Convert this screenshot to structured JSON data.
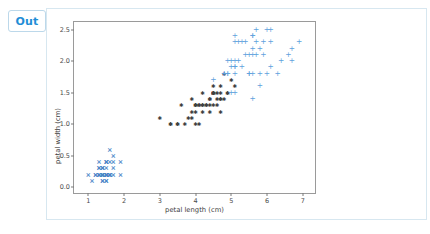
{
  "cell": {
    "out_label": "Out"
  },
  "chart_data": {
    "type": "scatter",
    "title": "",
    "xlabel": "petal length (cm)",
    "ylabel": "petal width (cm)",
    "xlim": [
      0.6,
      7.4
    ],
    "ylim": [
      -0.12,
      2.62
    ],
    "xticks": [
      "1",
      "2",
      "3",
      "4",
      "5",
      "6",
      "7"
    ],
    "xtick_values": [
      1,
      2,
      3,
      4,
      5,
      6,
      7
    ],
    "yticks": [
      "0.0",
      "0.5",
      "1.0",
      "1.5",
      "2.0",
      "2.5"
    ],
    "ytick_values": [
      0.0,
      0.5,
      1.0,
      1.5,
      2.0,
      2.5
    ],
    "grid": false,
    "legend": "none",
    "series": [
      {
        "name": "setosa",
        "marker": "x",
        "glyph": "×",
        "color": "#4a86c8",
        "points": [
          [
            1.4,
            0.2
          ],
          [
            1.4,
            0.2
          ],
          [
            1.3,
            0.2
          ],
          [
            1.5,
            0.2
          ],
          [
            1.4,
            0.2
          ],
          [
            1.7,
            0.4
          ],
          [
            1.4,
            0.3
          ],
          [
            1.5,
            0.2
          ],
          [
            1.4,
            0.2
          ],
          [
            1.5,
            0.1
          ],
          [
            1.5,
            0.2
          ],
          [
            1.6,
            0.2
          ],
          [
            1.4,
            0.1
          ],
          [
            1.1,
            0.1
          ],
          [
            1.2,
            0.2
          ],
          [
            1.5,
            0.4
          ],
          [
            1.3,
            0.4
          ],
          [
            1.4,
            0.3
          ],
          [
            1.7,
            0.3
          ],
          [
            1.5,
            0.3
          ],
          [
            1.7,
            0.2
          ],
          [
            1.5,
            0.4
          ],
          [
            1.0,
            0.2
          ],
          [
            1.7,
            0.5
          ],
          [
            1.9,
            0.2
          ],
          [
            1.6,
            0.2
          ],
          [
            1.6,
            0.4
          ],
          [
            1.5,
            0.2
          ],
          [
            1.4,
            0.2
          ],
          [
            1.6,
            0.2
          ],
          [
            1.6,
            0.2
          ],
          [
            1.5,
            0.4
          ],
          [
            1.5,
            0.1
          ],
          [
            1.4,
            0.2
          ],
          [
            1.5,
            0.2
          ],
          [
            1.2,
            0.2
          ],
          [
            1.3,
            0.2
          ],
          [
            1.4,
            0.1
          ],
          [
            1.3,
            0.2
          ],
          [
            1.5,
            0.2
          ],
          [
            1.3,
            0.3
          ],
          [
            1.3,
            0.3
          ],
          [
            1.3,
            0.2
          ],
          [
            1.6,
            0.6
          ],
          [
            1.9,
            0.4
          ],
          [
            1.4,
            0.3
          ],
          [
            1.6,
            0.2
          ],
          [
            1.4,
            0.2
          ],
          [
            1.5,
            0.2
          ],
          [
            1.4,
            0.2
          ]
        ]
      },
      {
        "name": "versicolor",
        "marker": "star",
        "glyph": "✱",
        "color": "#3f3f3f",
        "points": [
          [
            4.7,
            1.4
          ],
          [
            4.5,
            1.5
          ],
          [
            4.9,
            1.5
          ],
          [
            4.0,
            1.3
          ],
          [
            4.6,
            1.5
          ],
          [
            4.5,
            1.3
          ],
          [
            4.7,
            1.6
          ],
          [
            3.3,
            1.0
          ],
          [
            4.6,
            1.3
          ],
          [
            3.9,
            1.4
          ],
          [
            3.5,
            1.0
          ],
          [
            4.2,
            1.5
          ],
          [
            4.0,
            1.0
          ],
          [
            4.7,
            1.4
          ],
          [
            3.6,
            1.3
          ],
          [
            4.4,
            1.4
          ],
          [
            4.5,
            1.5
          ],
          [
            4.1,
            1.0
          ],
          [
            4.5,
            1.5
          ],
          [
            3.9,
            1.1
          ],
          [
            4.8,
            1.8
          ],
          [
            4.0,
            1.3
          ],
          [
            4.9,
            1.5
          ],
          [
            4.7,
            1.2
          ],
          [
            4.3,
            1.3
          ],
          [
            4.4,
            1.4
          ],
          [
            4.8,
            1.4
          ],
          [
            5.0,
            1.7
          ],
          [
            4.5,
            1.5
          ],
          [
            3.5,
            1.0
          ],
          [
            3.8,
            1.1
          ],
          [
            3.7,
            1.0
          ],
          [
            3.9,
            1.2
          ],
          [
            5.1,
            1.6
          ],
          [
            4.5,
            1.5
          ],
          [
            4.5,
            1.6
          ],
          [
            4.7,
            1.5
          ],
          [
            4.4,
            1.3
          ],
          [
            4.1,
            1.3
          ],
          [
            4.0,
            1.3
          ],
          [
            4.4,
            1.2
          ],
          [
            4.6,
            1.4
          ],
          [
            4.0,
            1.2
          ],
          [
            3.3,
            1.0
          ],
          [
            4.2,
            1.3
          ],
          [
            4.2,
            1.2
          ],
          [
            4.2,
            1.3
          ],
          [
            4.3,
            1.3
          ],
          [
            3.0,
            1.1
          ],
          [
            4.1,
            1.3
          ]
        ]
      },
      {
        "name": "virginica",
        "marker": "+",
        "glyph": "+",
        "color": "#5fa2dd",
        "points": [
          [
            6.0,
            2.5
          ],
          [
            5.1,
            1.9
          ],
          [
            5.9,
            2.1
          ],
          [
            5.6,
            1.8
          ],
          [
            5.8,
            2.2
          ],
          [
            6.6,
            2.1
          ],
          [
            4.5,
            1.7
          ],
          [
            6.3,
            1.8
          ],
          [
            5.8,
            1.8
          ],
          [
            6.1,
            2.5
          ],
          [
            5.1,
            2.0
          ],
          [
            5.3,
            1.9
          ],
          [
            5.5,
            2.1
          ],
          [
            5.0,
            2.0
          ],
          [
            5.1,
            2.4
          ],
          [
            5.3,
            2.3
          ],
          [
            5.5,
            1.8
          ],
          [
            6.7,
            2.2
          ],
          [
            6.9,
            2.3
          ],
          [
            5.0,
            1.5
          ],
          [
            5.7,
            2.3
          ],
          [
            4.9,
            2.0
          ],
          [
            6.7,
            2.0
          ],
          [
            4.9,
            1.8
          ],
          [
            5.7,
            2.1
          ],
          [
            6.0,
            1.8
          ],
          [
            4.8,
            1.8
          ],
          [
            4.9,
            1.8
          ],
          [
            5.6,
            2.1
          ],
          [
            5.8,
            1.6
          ],
          [
            6.1,
            1.9
          ],
          [
            6.4,
            2.0
          ],
          [
            5.6,
            2.2
          ],
          [
            5.1,
            1.5
          ],
          [
            5.6,
            1.4
          ],
          [
            6.1,
            2.3
          ],
          [
            5.6,
            2.4
          ],
          [
            5.5,
            1.8
          ],
          [
            4.8,
            1.8
          ],
          [
            5.4,
            2.1
          ],
          [
            5.6,
            2.4
          ],
          [
            5.1,
            2.3
          ],
          [
            5.1,
            1.9
          ],
          [
            5.9,
            2.3
          ],
          [
            5.7,
            2.5
          ],
          [
            5.2,
            2.3
          ],
          [
            5.0,
            1.9
          ],
          [
            5.2,
            2.0
          ],
          [
            5.4,
            2.3
          ],
          [
            5.1,
            1.8
          ]
        ]
      }
    ]
  }
}
